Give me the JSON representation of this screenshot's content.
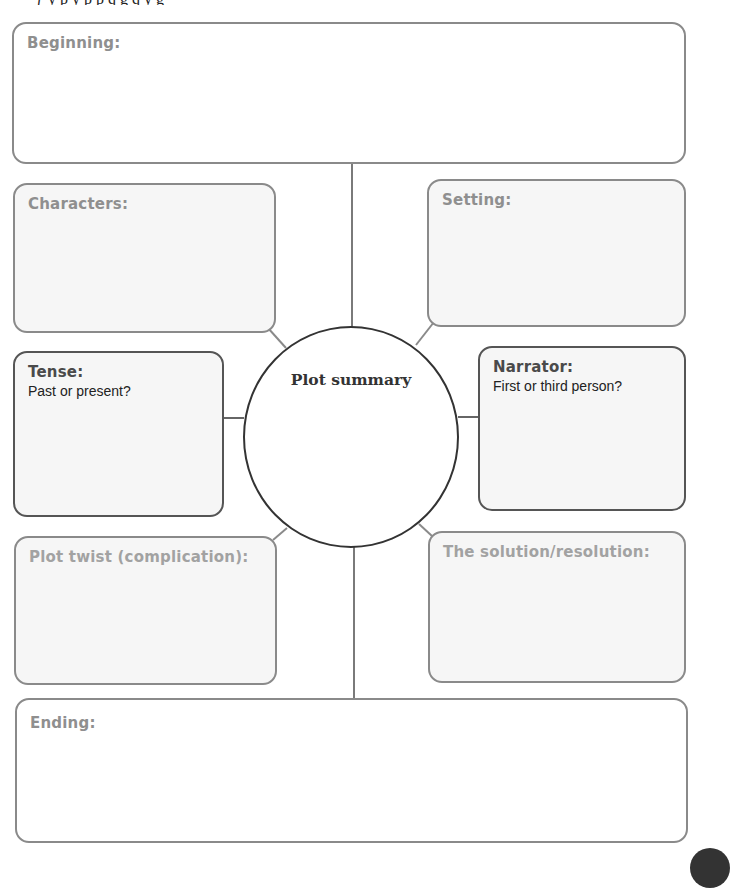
{
  "diagram": {
    "type": "story-planning-map",
    "center": {
      "title": "Plot summary"
    },
    "boxes": {
      "beginning": {
        "title": "Beginning:"
      },
      "characters": {
        "title": "Characters:"
      },
      "setting": {
        "title": "Setting:"
      },
      "tense": {
        "title": "Tense:",
        "prompt": "Past or present?"
      },
      "narrator": {
        "title": "Narrator:",
        "prompt": "First or third person?"
      },
      "plot_twist": {
        "title": "Plot twist (complication):"
      },
      "solution": {
        "title": "The solution/resolution:"
      },
      "ending": {
        "title": "Ending:"
      }
    },
    "colors": {
      "box_border": "#8a8a8a",
      "box_border_dark": "#555555",
      "box_fill": "#f6f6f6",
      "circle_border": "#333333",
      "connector": "#7a7a7a"
    }
  }
}
